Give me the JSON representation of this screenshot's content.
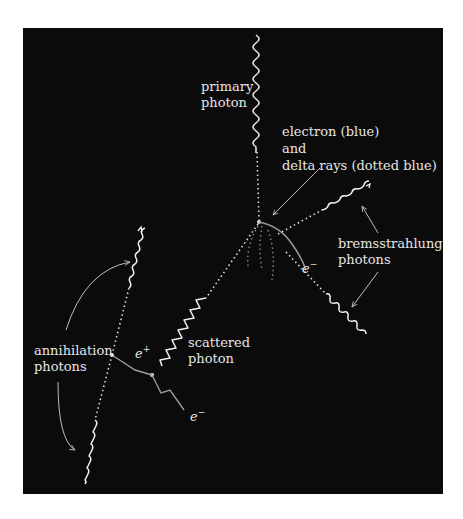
{
  "diagram": {
    "background_color": "#0b0b0b",
    "colors": {
      "photon": "#f2f2f2",
      "electron": "#9a9a9a",
      "delta_ray": "#9a9a9a",
      "annotation_arrow": "#bdbdbd",
      "text": "#e6e6e6"
    },
    "labels": {
      "primary_photon": [
        "primary",
        "photon"
      ],
      "electron_delta": [
        "electron (blue)",
        "and",
        "delta rays (dotted blue)"
      ],
      "bremsstrahlung": [
        "bremsstrahlung",
        "photons"
      ],
      "electron_symbol_1": "e",
      "electron_sign_1": "−",
      "scattered_photon": [
        "scattered",
        "photon"
      ],
      "positron_symbol": "e",
      "positron_sign": "+",
      "electron_symbol_2": "e",
      "electron_sign_2": "−",
      "annihilation": [
        "annihilation",
        "photons"
      ]
    },
    "nodes": [
      {
        "id": "compton-vertex",
        "x": 259,
        "y": 222
      },
      {
        "id": "pair-vertex",
        "x": 152,
        "y": 375
      },
      {
        "id": "annihilation-point",
        "x": 112,
        "y": 355
      }
    ]
  }
}
